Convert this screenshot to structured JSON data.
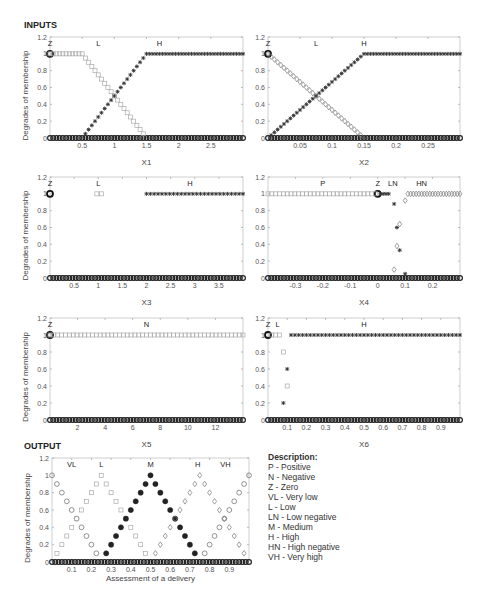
{
  "labels": {
    "inputs": "INPUTS",
    "output": "OUTPUT"
  },
  "description": {
    "title": "Description:",
    "items": [
      "P - Positive",
      "N - Negative",
      "Z - Zero",
      "VL - Very low",
      "L - Low",
      "LN - Low negative",
      "M - Medium",
      "H - High",
      "HN - High negative",
      "VH - Very high"
    ]
  },
  "chart_data": [
    {
      "id": "x1",
      "type": "scatter",
      "xlabel": "X1",
      "ylabel": "Degrades of membership",
      "xlim": [
        0,
        3
      ],
      "ylim": [
        0,
        1.2
      ],
      "xticks": [
        0.5,
        1,
        1.5,
        2,
        2.5
      ],
      "yticks": [
        0,
        0.2,
        0.4,
        0.6,
        0.8,
        1,
        1.2
      ],
      "box": {
        "x": 50,
        "y": 37,
        "w": 193,
        "h": 101
      },
      "term_labels": [
        {
          "text": "Z",
          "x": 0.0
        },
        {
          "text": "L",
          "x": 0.75
        },
        {
          "text": "H",
          "x": 1.7
        }
      ],
      "series": [
        {
          "name": "Z",
          "marker": "circle-bold",
          "points": [
            [
              0,
              1
            ]
          ]
        },
        {
          "name": "L",
          "marker": "square",
          "trap": [
            0,
            0,
            0.5,
            1.5
          ]
        },
        {
          "name": "H",
          "marker": "star",
          "trap": [
            0.5,
            1.5,
            3,
            3
          ]
        }
      ]
    },
    {
      "id": "x2",
      "type": "scatter",
      "xlabel": "X2",
      "ylabel": "",
      "xlim": [
        0,
        0.3
      ],
      "ylim": [
        0,
        1.2
      ],
      "xticks": [
        0.05,
        0.1,
        0.15,
        0.2,
        0.25
      ],
      "yticks": [
        0,
        0.2,
        0.4,
        0.6,
        0.8,
        1,
        1.2
      ],
      "box": {
        "x": 268,
        "y": 37,
        "w": 192,
        "h": 101
      },
      "term_labels": [
        {
          "text": "Z",
          "x": 0.0
        },
        {
          "text": "L",
          "x": 0.075
        },
        {
          "text": "H",
          "x": 0.15
        }
      ],
      "series": [
        {
          "name": "Z",
          "marker": "circle-bold",
          "points": [
            [
              0,
              1
            ]
          ]
        },
        {
          "name": "L",
          "marker": "diamond",
          "trap": [
            0,
            0,
            0,
            0.15
          ]
        },
        {
          "name": "H",
          "marker": "star",
          "trap": [
            0,
            0.15,
            0.3,
            0.3
          ]
        }
      ]
    },
    {
      "id": "x3",
      "type": "scatter",
      "xlabel": "X3",
      "ylabel": "Degrades of membership",
      "xlim": [
        0,
        4
      ],
      "ylim": [
        0,
        1.2
      ],
      "xticks": [
        0.5,
        1,
        1.5,
        2,
        2.5,
        3,
        3.5
      ],
      "yticks": [
        0,
        0.2,
        0.4,
        0.6,
        0.8,
        1,
        1.2
      ],
      "box": {
        "x": 50,
        "y": 177,
        "w": 193,
        "h": 101
      },
      "term_labels": [
        {
          "text": "Z",
          "x": 0.0
        },
        {
          "text": "L",
          "x": 1.0
        },
        {
          "text": "H",
          "x": 2.9
        }
      ],
      "series": [
        {
          "name": "Z",
          "marker": "circle-bold",
          "points": [
            [
              0,
              1
            ]
          ]
        },
        {
          "name": "L",
          "marker": "square",
          "points": [
            [
              0.97,
              1
            ],
            [
              1.07,
              1
            ]
          ]
        },
        {
          "name": "H",
          "marker": "star",
          "step": [
            2,
            4,
            1
          ]
        }
      ]
    },
    {
      "id": "x4",
      "type": "scatter",
      "xlabel": "X4",
      "ylabel": "",
      "xlim": [
        -0.4,
        0.3
      ],
      "ylim": [
        0,
        1.2
      ],
      "xticks": [
        -0.3,
        -0.2,
        -0.1,
        0,
        0.1,
        0.2
      ],
      "yticks": [
        0,
        0.2,
        0.4,
        0.6,
        0.8,
        1,
        1.2
      ],
      "box": {
        "x": 268,
        "y": 177,
        "w": 192,
        "h": 101
      },
      "term_labels": [
        {
          "text": "P",
          "x": -0.2
        },
        {
          "text": "Z",
          "x": 0.0
        },
        {
          "text": "LN",
          "x": 0.055
        },
        {
          "text": "HN",
          "x": 0.16
        }
      ],
      "series": [
        {
          "name": "Z",
          "marker": "circle-bold",
          "points": [
            [
              0,
              1
            ]
          ]
        },
        {
          "name": "P",
          "marker": "square",
          "step": [
            -0.4,
            0,
            1
          ]
        },
        {
          "name": "LN",
          "marker": "star",
          "points": [
            [
              0.01,
              1
            ],
            [
              0.02,
              1
            ],
            [
              0.03,
              1
            ],
            [
              0.04,
              1
            ],
            [
              0.06,
              0.88
            ],
            [
              0.07,
              0.6
            ],
            [
              0.08,
              0.33
            ],
            [
              0.1,
              0.05
            ]
          ]
        },
        {
          "name": "HN",
          "marker": "diamond",
          "points": [
            [
              0.06,
              0.1
            ],
            [
              0.07,
              0.38
            ],
            [
              0.08,
              0.64
            ],
            [
              0.1,
              0.92
            ],
            [
              0.11,
              1
            ],
            [
              0.12,
              1
            ],
            [
              0.13,
              1
            ],
            [
              0.14,
              1
            ],
            [
              0.15,
              1
            ],
            [
              0.16,
              1
            ],
            [
              0.17,
              1
            ],
            [
              0.18,
              1
            ],
            [
              0.19,
              1
            ],
            [
              0.2,
              1
            ],
            [
              0.21,
              1
            ],
            [
              0.22,
              1
            ],
            [
              0.23,
              1
            ],
            [
              0.24,
              1
            ],
            [
              0.25,
              1
            ],
            [
              0.26,
              1
            ],
            [
              0.27,
              1
            ],
            [
              0.28,
              1
            ],
            [
              0.29,
              1
            ],
            [
              0.3,
              1
            ]
          ]
        }
      ]
    },
    {
      "id": "x5",
      "type": "scatter",
      "xlabel": "X5",
      "ylabel": "Degrades of membership",
      "xlim": [
        0,
        14
      ],
      "ylim": [
        0,
        1.2
      ],
      "xticks": [
        2,
        4,
        6,
        8,
        10,
        12
      ],
      "yticks": [
        0,
        0.2,
        0.4,
        0.6,
        0.8,
        1,
        1.2
      ],
      "box": {
        "x": 50,
        "y": 318,
        "w": 193,
        "h": 102
      },
      "term_labels": [
        {
          "text": "Z",
          "x": 0.0
        },
        {
          "text": "N",
          "x": 7
        }
      ],
      "series": [
        {
          "name": "Z",
          "marker": "circle-bold",
          "points": [
            [
              0,
              1
            ]
          ]
        },
        {
          "name": "N",
          "marker": "square",
          "step": [
            0,
            14,
            1
          ]
        }
      ]
    },
    {
      "id": "x6",
      "type": "scatter",
      "xlabel": "X6",
      "ylabel": "",
      "xlim": [
        0,
        1
      ],
      "ylim": [
        0,
        1.2
      ],
      "xticks": [
        0.1,
        0.2,
        0.3,
        0.4,
        0.5,
        0.6,
        0.7,
        0.8,
        0.9
      ],
      "yticks": [
        0,
        0.2,
        0.4,
        0.6,
        0.8,
        1,
        1.2
      ],
      "box": {
        "x": 268,
        "y": 318,
        "w": 192,
        "h": 102
      },
      "term_labels": [
        {
          "text": "Z",
          "x": 0.0
        },
        {
          "text": "L",
          "x": 0.05
        },
        {
          "text": "H",
          "x": 0.5
        }
      ],
      "series": [
        {
          "name": "Z",
          "marker": "circle-bold",
          "points": [
            [
              0,
              1
            ]
          ]
        },
        {
          "name": "L",
          "marker": "square",
          "points": [
            [
              0.02,
              1
            ],
            [
              0.04,
              1
            ],
            [
              0.06,
              1
            ],
            [
              0.08,
              0.8
            ],
            [
              0.1,
              0.4
            ]
          ]
        },
        {
          "name": "H",
          "marker": "star",
          "points": [
            [
              0.08,
              0.2
            ],
            [
              0.1,
              0.6
            ],
            [
              0.12,
              1
            ],
            [
              0.14,
              1
            ],
            [
              0.16,
              1
            ],
            [
              0.18,
              1
            ],
            [
              0.2,
              1
            ],
            [
              0.22,
              1
            ],
            [
              0.24,
              1
            ],
            [
              0.26,
              1
            ],
            [
              0.28,
              1
            ],
            [
              0.3,
              1
            ],
            [
              0.32,
              1
            ],
            [
              0.34,
              1
            ],
            [
              0.36,
              1
            ],
            [
              0.38,
              1
            ],
            [
              0.4,
              1
            ],
            [
              0.42,
              1
            ],
            [
              0.44,
              1
            ],
            [
              0.46,
              1
            ],
            [
              0.48,
              1
            ],
            [
              0.5,
              1
            ],
            [
              0.52,
              1
            ],
            [
              0.54,
              1
            ],
            [
              0.56,
              1
            ],
            [
              0.58,
              1
            ],
            [
              0.6,
              1
            ],
            [
              0.62,
              1
            ],
            [
              0.64,
              1
            ],
            [
              0.66,
              1
            ],
            [
              0.68,
              1
            ],
            [
              0.7,
              1
            ],
            [
              0.72,
              1
            ],
            [
              0.74,
              1
            ],
            [
              0.76,
              1
            ],
            [
              0.78,
              1
            ],
            [
              0.8,
              1
            ],
            [
              0.82,
              1
            ],
            [
              0.84,
              1
            ],
            [
              0.86,
              1
            ],
            [
              0.88,
              1
            ],
            [
              0.9,
              1
            ],
            [
              0.92,
              1
            ],
            [
              0.94,
              1
            ],
            [
              0.96,
              1
            ],
            [
              0.98,
              1
            ],
            [
              1,
              1
            ]
          ]
        }
      ]
    },
    {
      "id": "output",
      "type": "scatter",
      "xlabel": "Assessment of a delivery",
      "ylabel": "Degrades of membership",
      "xlim": [
        0,
        1
      ],
      "ylim": [
        0,
        1.2
      ],
      "xticks": [
        0.1,
        0.2,
        0.3,
        0.4,
        0.5,
        0.6,
        0.7,
        0.8,
        0.9
      ],
      "yticks": [
        0,
        0.2,
        0.4,
        0.6,
        0.8,
        1,
        1.2
      ],
      "box": {
        "x": 52,
        "y": 458,
        "w": 197,
        "h": 104
      },
      "term_labels": [
        {
          "text": "VL",
          "x": 0.1
        },
        {
          "text": "L",
          "x": 0.25
        },
        {
          "text": "M",
          "x": 0.5
        },
        {
          "text": "H",
          "x": 0.74
        },
        {
          "text": "VH",
          "x": 0.88
        }
      ],
      "series": [
        {
          "name": "VL",
          "marker": "circle",
          "tri": [
            -0.25,
            0,
            0.25
          ]
        },
        {
          "name": "L",
          "marker": "square",
          "tri": [
            0,
            0.25,
            0.5
          ]
        },
        {
          "name": "M",
          "marker": "filled-circle",
          "tri": [
            0.25,
            0.5,
            0.75
          ]
        },
        {
          "name": "H",
          "marker": "diamond",
          "tri": [
            0.5,
            0.75,
            1
          ]
        },
        {
          "name": "VH",
          "marker": "circle",
          "tri": [
            0.75,
            1,
            1.25
          ]
        }
      ]
    }
  ]
}
